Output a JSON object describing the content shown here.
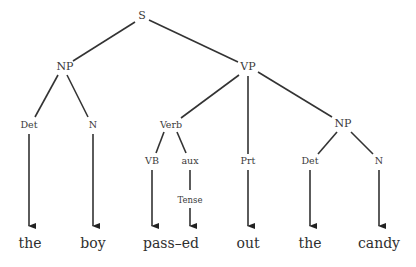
{
  "diagram": {
    "type": "parse-tree",
    "nodes": {
      "S": "S",
      "NP": "NP",
      "VP": "VP",
      "Det1": "Det",
      "N1": "N",
      "Verb": "Verb",
      "Prt": "Prt",
      "NP2": "NP",
      "VB": "VB",
      "aux": "aux",
      "Tense": "Tense",
      "Det2": "Det",
      "N2": "N"
    },
    "words": [
      "the",
      "boy",
      "pass–ed",
      "out",
      "the",
      "candy"
    ],
    "edges": [
      [
        "S",
        "NP"
      ],
      [
        "S",
        "VP"
      ],
      [
        "NP",
        "Det1"
      ],
      [
        "NP",
        "N1"
      ],
      [
        "VP",
        "Verb"
      ],
      [
        "VP",
        "Prt"
      ],
      [
        "VP",
        "NP2"
      ],
      [
        "Verb",
        "VB"
      ],
      [
        "Verb",
        "aux"
      ],
      [
        "aux",
        "Tense"
      ],
      [
        "NP2",
        "Det2"
      ],
      [
        "NP2",
        "N2"
      ]
    ],
    "arrows": [
      [
        "Det1",
        "word0"
      ],
      [
        "N1",
        "word1"
      ],
      [
        "VB",
        "word2"
      ],
      [
        "Tense",
        "word2"
      ],
      [
        "Prt",
        "word3"
      ],
      [
        "Det2",
        "word4"
      ],
      [
        "N2",
        "word5"
      ]
    ]
  }
}
